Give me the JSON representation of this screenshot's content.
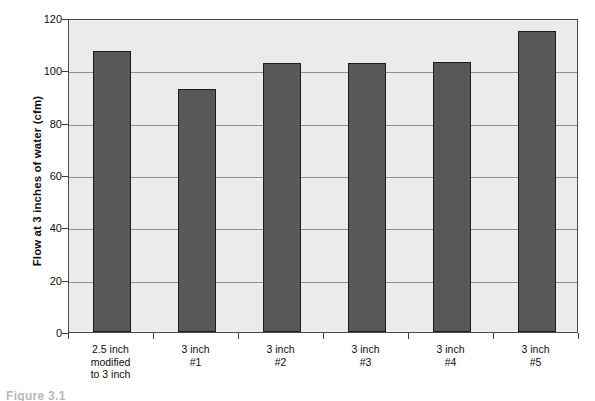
{
  "caption": {
    "text": "Figure 3.1"
  },
  "chart_data": {
    "type": "bar",
    "title": "",
    "xlabel": "",
    "ylabel": "Flow at 3 inches of water (cfm)",
    "ylim": [
      0,
      120
    ],
    "yticks": [
      0,
      20,
      40,
      60,
      80,
      100,
      120
    ],
    "ytick_labels": [
      "0",
      "20",
      "40",
      "60",
      "80",
      "100",
      "120"
    ],
    "grid": true,
    "legend": "none",
    "bar_color": "#585858",
    "plot_background": "#ebebeb",
    "categories": [
      "2.5 inch modified to 3 inch",
      "3 inch #1",
      "3 inch #2",
      "3 inch #3",
      "3 inch #4",
      "3 inch #5"
    ],
    "category_lines": [
      [
        "2.5 inch",
        "modified",
        "to 3 inch"
      ],
      [
        "3 inch",
        "#1"
      ],
      [
        "3 inch",
        "#2"
      ],
      [
        "3 inch",
        "#3"
      ],
      [
        "3 inch",
        "#4"
      ],
      [
        "3 inch",
        "#5"
      ]
    ],
    "values": [
      107.4,
      92.8,
      102.8,
      102.8,
      103.2,
      115.0
    ]
  }
}
